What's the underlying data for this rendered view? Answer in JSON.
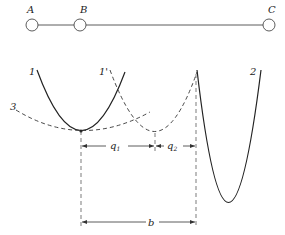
{
  "nodes": [
    {
      "id": "A",
      "label": "A",
      "cx": 32,
      "cy": 25,
      "r": 6
    },
    {
      "id": "B",
      "label": "B",
      "cx": 80,
      "cy": 25,
      "r": 6
    },
    {
      "id": "C",
      "label": "C",
      "cx": 269,
      "cy": 25,
      "r": 6
    }
  ],
  "curves": {
    "curve_1": {
      "label": "1",
      "style": "solid"
    },
    "curve_1_prime": {
      "label": "1'",
      "style": "dashed"
    },
    "curve_2": {
      "label": "2",
      "style": "solid"
    },
    "curve_3": {
      "label": "3",
      "style": "dashed"
    }
  },
  "dimensions": {
    "q1": {
      "label": "q",
      "sub": "1"
    },
    "q2": {
      "label": "q",
      "sub": "2"
    },
    "b": {
      "label": "b"
    }
  },
  "colors": {
    "line": "#222222",
    "background": "#ffffff"
  }
}
